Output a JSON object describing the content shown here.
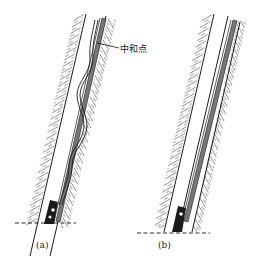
{
  "diagram": {
    "panels": [
      {
        "id": "a",
        "caption": "(a)",
        "description": "Inclined wellbore with buckled drill string above bit",
        "annotation": "中和点"
      },
      {
        "id": "b",
        "caption": "(b)",
        "description": "Inclined wellbore with straight drill string resting on low side"
      }
    ],
    "colors": {
      "line": "#1a1a1a",
      "hatch": "#555555",
      "background": "#ffffff"
    }
  }
}
